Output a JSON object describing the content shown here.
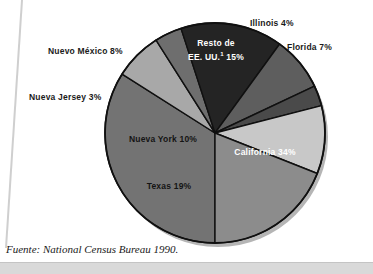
{
  "figure": {
    "source_note": "Fuente: National Census Bureau 1990.",
    "footnote_marker": "1"
  },
  "chart_data": {
    "type": "pie",
    "title": "",
    "subtitle": "",
    "xlabel": "",
    "ylabel": "",
    "legend_position": "none",
    "grid": false,
    "units": "percent",
    "total": 100,
    "categories": [
      "California",
      "Florida",
      "Illinois",
      "Resto de EE. UU.",
      "Nuevo México",
      "Nueva Jersey",
      "Nueva York",
      "Texas"
    ],
    "values": [
      34,
      7,
      4,
      15,
      8,
      3,
      10,
      19
    ],
    "slices": [
      {
        "name": "California",
        "label": "California 34%",
        "value": 34,
        "color": "#737373",
        "label_placement": "inside",
        "label_color": "#ffffff"
      },
      {
        "name": "Florida",
        "label": "Florida 7%",
        "value": 7,
        "color": "#a8a8a8",
        "label_placement": "outside",
        "label_color": "#1a1a1a"
      },
      {
        "name": "Illinois",
        "label": "Illinois 4%",
        "value": 4,
        "color": "#6e6e6e",
        "label_placement": "outside",
        "label_color": "#1a1a1a"
      },
      {
        "name": "Resto de EE. UU.",
        "label_line1": "Resto de",
        "label_line2": "EE. UU.",
        "label_line2_suffix": " 15%",
        "value": 15,
        "color": "#242424",
        "label_placement": "inside",
        "label_color": "#ffffff"
      },
      {
        "name": "Nuevo México",
        "label": "Nuevo México 8%",
        "value": 8,
        "color": "#5e5e5e",
        "label_placement": "outside",
        "label_color": "#1a1a1a"
      },
      {
        "name": "Nueva Jersey",
        "label": "Nueva Jersey 3%",
        "value": 3,
        "color": "#4a4a4a",
        "label_placement": "outside",
        "label_color": "#1a1a1a"
      },
      {
        "name": "Nueva York",
        "label": "Nueva York 10%",
        "value": 10,
        "color": "#c8c8c8",
        "label_placement": "inside",
        "label_color": "#141414"
      },
      {
        "name": "Texas",
        "label": "Texas 19%",
        "value": 19,
        "color": "#8c8c8c",
        "label_placement": "inside",
        "label_color": "#141414"
      }
    ]
  }
}
